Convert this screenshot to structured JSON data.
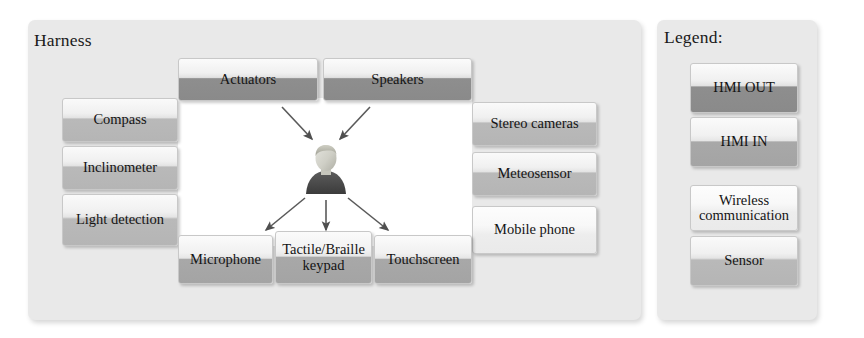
{
  "harness": {
    "title": "Harness",
    "nodes": [
      {
        "id": "actuators",
        "label": "Actuators",
        "style": "hmi-out",
        "x": 178,
        "y": 58,
        "w": 140,
        "h": 43
      },
      {
        "id": "speakers",
        "label": "Speakers",
        "style": "hmi-out",
        "x": 323,
        "y": 58,
        "w": 149,
        "h": 43
      },
      {
        "id": "compass",
        "label": "Compass",
        "style": "sensor",
        "x": 62,
        "y": 98,
        "w": 116,
        "h": 44
      },
      {
        "id": "inclinometer",
        "label": "Inclinometer",
        "style": "sensor",
        "x": 62,
        "y": 146,
        "w": 116,
        "h": 44
      },
      {
        "id": "light",
        "label": "Light detection",
        "style": "sensor",
        "x": 62,
        "y": 194,
        "w": 116,
        "h": 52
      },
      {
        "id": "stereo",
        "label": "Stereo cameras",
        "style": "sensor",
        "x": 472,
        "y": 102,
        "w": 125,
        "h": 44
      },
      {
        "id": "meteo",
        "label": "Meteosensor",
        "style": "sensor",
        "x": 472,
        "y": 152,
        "w": 125,
        "h": 44
      },
      {
        "id": "mobile",
        "label": "Mobile phone",
        "style": "wireless",
        "x": 472,
        "y": 206,
        "w": 125,
        "h": 48
      },
      {
        "id": "microphone",
        "label": "Microphone",
        "style": "hmi-in",
        "x": 178,
        "y": 235,
        "w": 95,
        "h": 49
      },
      {
        "id": "tactile",
        "label": "Tactile/Braille\nkeypad",
        "style": "hmi-in",
        "x": 275,
        "y": 231,
        "w": 97,
        "h": 53
      },
      {
        "id": "touchscreen",
        "label": "Touchscreen",
        "style": "hmi-in",
        "x": 374,
        "y": 235,
        "w": 98,
        "h": 49
      }
    ],
    "center_icon": "person-icon",
    "arrows": [
      {
        "name": "arrow-actuators-to-person",
        "x1": 282,
        "y1": 107,
        "x2": 312,
        "y2": 139
      },
      {
        "name": "arrow-speakers-to-person",
        "x1": 370,
        "y1": 107,
        "x2": 340,
        "y2": 139
      },
      {
        "name": "arrow-person-to-microphone",
        "x1": 305,
        "y1": 198,
        "x2": 266,
        "y2": 230
      },
      {
        "name": "arrow-person-to-tactile",
        "x1": 326,
        "y1": 200,
        "x2": 326,
        "y2": 230
      },
      {
        "name": "arrow-person-to-touchscreen",
        "x1": 348,
        "y1": 198,
        "x2": 388,
        "y2": 230
      }
    ]
  },
  "legend": {
    "title": "Legend:",
    "items": [
      {
        "id": "legend-hmi-out",
        "label": "HMI OUT",
        "style": "hmi-out",
        "x": 690,
        "y": 63,
        "w": 108,
        "h": 50
      },
      {
        "id": "legend-hmi-in",
        "label": "HMI IN",
        "style": "hmi-in",
        "x": 690,
        "y": 117,
        "w": 108,
        "h": 50
      },
      {
        "id": "legend-wireless",
        "label": "Wireless\ncommunication",
        "style": "wireless",
        "x": 690,
        "y": 185,
        "w": 108,
        "h": 46
      },
      {
        "id": "legend-sensor",
        "label": "Sensor",
        "style": "sensor",
        "x": 690,
        "y": 236,
        "w": 108,
        "h": 50
      }
    ]
  },
  "colors": {
    "panel_bg": "#e9e9e9",
    "canvas_bg": "#ffffff",
    "hmi_out": "#8e8e8e",
    "hmi_in": "#a8a8a8",
    "sensor": "#b9b9b9",
    "wireless": "#eaeaea",
    "text": "#141414",
    "arrow": "#5a5a5a"
  }
}
